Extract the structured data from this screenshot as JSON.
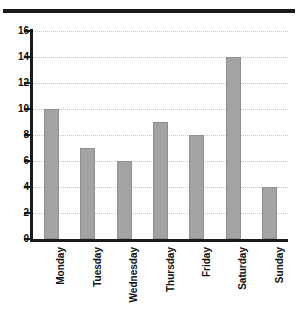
{
  "chart_data": {
    "type": "bar",
    "title": "",
    "subtitle": "",
    "xlabel": "",
    "ylabel": "",
    "categories": [
      "Monday",
      "Tuesday",
      "Wednesday",
      "Thursday",
      "Friday",
      "Saturday",
      "Sunday"
    ],
    "values": [
      10,
      7,
      6,
      9,
      8,
      14,
      4
    ],
    "ylim": [
      0,
      16
    ],
    "yticks": [
      0,
      2,
      4,
      6,
      8,
      10,
      12,
      14,
      16
    ],
    "ytick_labels": [
      "0",
      "2",
      "4",
      "6",
      "8",
      "10",
      "12",
      "14",
      "16"
    ],
    "grid": true,
    "grid_axis": "y",
    "grid_style": "dotted",
    "legend": false,
    "legend_position": "none",
    "xtick_rotation": 90,
    "bar_color": "#a3a3a3",
    "bar_edge_color": "#8f8f8f",
    "axis_color": "#1a1a1a",
    "grid_color": "#c8c8c8",
    "background_color": "#ffffff"
  },
  "decorations": {
    "top_rule_color": "#1a1a1a"
  }
}
